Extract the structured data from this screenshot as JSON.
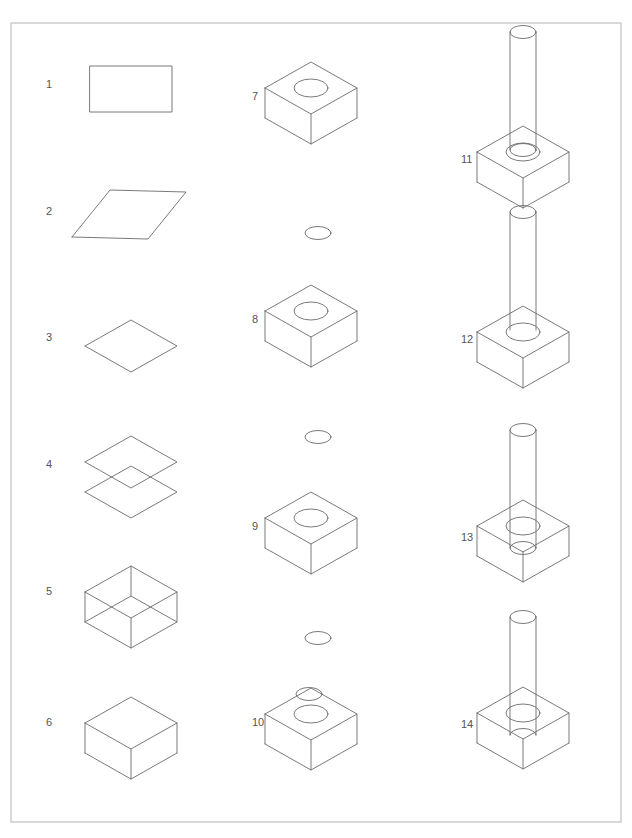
{
  "figure": {
    "border": {
      "x": 11,
      "y": 23,
      "width": 610,
      "height": 799,
      "color": "#b9b9b9"
    },
    "line_color": "#6b6b6b",
    "label_color": "#555555",
    "background": "#ffffff",
    "step_count": 14
  },
  "geometry": {
    "box": {
      "width": 92,
      "depth": 62,
      "height": 30,
      "iso_dx": 46,
      "iso_dy": 26
    },
    "hole": {
      "rx": 17,
      "ry": 9
    },
    "small_ellipse": {
      "rx": 13,
      "ry": 6.5
    },
    "cylinder": {
      "rx": 13,
      "ry": 6.5,
      "height": 118
    }
  },
  "columns": [
    {
      "name": "column-left",
      "label_x": 46
    },
    {
      "name": "column-middle",
      "label_x": 252
    },
    {
      "name": "column-right",
      "label_x": 461
    }
  ],
  "steps": [
    {
      "id": 1,
      "label": "1",
      "label_x": 46,
      "label_y": 85,
      "origin_x": 90,
      "origin_y": 66,
      "kind": "rectangle",
      "description": "Flat 2D rectangle profile sketched in plan view",
      "parts": [
        "rectangle-profile"
      ]
    },
    {
      "id": 2,
      "label": "2",
      "label_x": 46,
      "label_y": 212,
      "origin_x": 72,
      "origin_y": 190,
      "kind": "parallelogram-skewed",
      "description": "Rectangle sheared into a skewed parallelogram",
      "parts": [
        "skewed-parallelogram"
      ]
    },
    {
      "id": 3,
      "label": "3",
      "label_x": 46,
      "label_y": 338,
      "origin_x": 85,
      "origin_y": 320,
      "kind": "parallelogram-isometric",
      "description": "Profile rotated into isometric top-face orientation",
      "parts": [
        "isometric-face"
      ]
    },
    {
      "id": 4,
      "label": "4",
      "label_x": 46,
      "label_y": 465,
      "origin_x": 85,
      "origin_y": 436,
      "kind": "two-faces",
      "description": "Top face copied and offset downward to set the thickness",
      "offset_y": 30,
      "parts": [
        "top-face",
        "bottom-face"
      ]
    },
    {
      "id": 5,
      "label": "5",
      "label_x": 46,
      "label_y": 592,
      "origin_x": 85,
      "origin_y": 566,
      "kind": "wireframe-box",
      "description": "Vertical edges added - full wireframe box with hidden lines",
      "offset_y": 30,
      "parts": [
        "top-face",
        "bottom-face",
        "vertical-edges"
      ]
    },
    {
      "id": 6,
      "label": "6",
      "label_x": 46,
      "label_y": 723,
      "origin_x": 85,
      "origin_y": 697,
      "kind": "solid-box",
      "description": "Hidden lines removed - solid rectangular block",
      "offset_y": 30,
      "parts": [
        "solid-box"
      ]
    },
    {
      "id": 7,
      "label": "7",
      "label_x": 252,
      "label_y": 97,
      "origin_x": 265,
      "origin_y": 62,
      "kind": "solid-box-with-hole-circle",
      "description": "Circle sketched on the top face of the block",
      "offset_y": 30,
      "parts": [
        "solid-box",
        "hole-ellipse"
      ]
    },
    {
      "id": 8,
      "label": "8",
      "label_x": 252,
      "label_y": 320,
      "origin_x": 265,
      "origin_y": 285,
      "kind": "solid-box-with-hole-circle",
      "description": "Block with circle, separate profile circle staged below",
      "offset_y": 30,
      "parts": [
        "solid-box",
        "hole-ellipse"
      ]
    },
    {
      "id": 9,
      "label": "9",
      "label_x": 252,
      "label_y": 527,
      "origin_x": 265,
      "origin_y": 492,
      "kind": "solid-box-with-hole-circle",
      "description": "Block with circle, second staged profile circle below",
      "offset_y": 30,
      "parts": [
        "solid-box",
        "hole-ellipse"
      ]
    },
    {
      "id": 10,
      "label": "10",
      "label_x": 252,
      "label_y": 723,
      "origin_x": 265,
      "origin_y": 688,
      "kind": "solid-box-hole-plus-edge-circle",
      "description": "Small circle placed on the rear top edge of the block",
      "offset_y": 30,
      "parts": [
        "solid-box",
        "hole-ellipse",
        "edge-ellipse"
      ]
    },
    {
      "id": 11,
      "label": "11",
      "label_x": 461,
      "label_y": 160,
      "origin_x": 477,
      "origin_y": 126,
      "kind": "box-with-cylinder-full",
      "description": "Circle extruded upward into a cylinder, base ellipse still shown",
      "offset_y": 30,
      "cylinder_height": 118,
      "show_cylinder_base": true,
      "cylinder_inserted": false,
      "parts": [
        "solid-box",
        "hole-ellipse",
        "cylinder",
        "cylinder-base-ellipse"
      ]
    },
    {
      "id": 12,
      "label": "12",
      "label_x": 461,
      "label_y": 340,
      "origin_x": 477,
      "origin_y": 306,
      "kind": "box-with-cylinder-clean",
      "description": "Cylinder base ellipse removed, pin resting above the hole",
      "offset_y": 30,
      "cylinder_height": 118,
      "show_cylinder_base": false,
      "cylinder_inserted": false,
      "parts": [
        "solid-box",
        "hole-ellipse",
        "cylinder"
      ]
    },
    {
      "id": 13,
      "label": "13",
      "label_x": 461,
      "label_y": 538,
      "origin_x": 477,
      "origin_y": 500,
      "kind": "box-with-cylinder-inserted",
      "description": "Cylinder lowered into the hole, intersection edges visible",
      "offset_y": 30,
      "cylinder_height": 118,
      "show_cylinder_base": true,
      "cylinder_inserted": true,
      "insert_depth": 22,
      "parts": [
        "solid-box",
        "hole-ellipse",
        "cylinder",
        "cylinder-base-ellipse"
      ]
    },
    {
      "id": 14,
      "label": "14",
      "label_x": 461,
      "label_y": 725,
      "origin_x": 477,
      "origin_y": 687,
      "kind": "box-with-cylinder-final",
      "description": "Final assembly - pin seated in the block, hidden lines removed",
      "offset_y": 30,
      "cylinder_height": 118,
      "show_cylinder_base": false,
      "cylinder_inserted": true,
      "insert_depth": 22,
      "parts": [
        "solid-box",
        "hole-ellipse",
        "cylinder"
      ]
    }
  ],
  "staged_circles": [
    {
      "name": "staged-circle-1",
      "cx": 318,
      "cy": 233,
      "rx": 13,
      "ry": 6.5,
      "between_steps": "7-8"
    },
    {
      "name": "staged-circle-2",
      "cx": 318,
      "cy": 437,
      "rx": 13,
      "ry": 6.5,
      "between_steps": "8-9"
    },
    {
      "name": "staged-circle-3",
      "cx": 318,
      "cy": 638,
      "rx": 13,
      "ry": 6.5,
      "between_steps": "9-10"
    }
  ]
}
